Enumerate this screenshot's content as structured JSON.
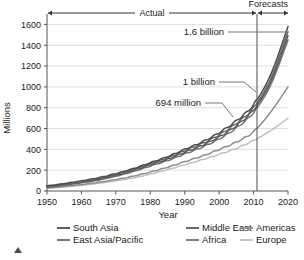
{
  "chart_data": {
    "type": "line",
    "title": "",
    "xlabel": "Year",
    "ylabel": "Millions",
    "xlim": [
      1950,
      2020
    ],
    "ylim": [
      0,
      1700
    ],
    "xticks": [
      "1950",
      "1960",
      "1970",
      "1980",
      "1990",
      "2000",
      "2010",
      "2020"
    ],
    "yticks": [
      "0",
      "200",
      "400",
      "600",
      "800",
      "1000",
      "1200",
      "1400",
      "1600"
    ],
    "grid": true,
    "legend_position": "bottom",
    "forecast_divider_year": 2011,
    "bands": [
      {
        "label": "Actual",
        "from": 1950,
        "to": 2011
      },
      {
        "label": "Forecasts",
        "from": 2011,
        "to": 2020
      }
    ],
    "annotations": [
      {
        "label": "1.6 billion",
        "value": 1600,
        "year": 2020
      },
      {
        "label": "1 billion",
        "value": 1000,
        "year": 2011
      },
      {
        "label": "694 million",
        "value": 694,
        "year": 2004
      }
    ],
    "x": [
      1950,
      1955,
      1960,
      1965,
      1970,
      1975,
      1980,
      1985,
      1990,
      1995,
      2000,
      2005,
      2010,
      2015,
      2020
    ],
    "series": [
      {
        "name": "South Asia",
        "color": "#4d4d4d",
        "values": [
          50,
          72,
          98,
          128,
          168,
          215,
          272,
          330,
          400,
          470,
          560,
          675,
          830,
          1120,
          1580
        ]
      },
      {
        "name": "East Asia/Pacific",
        "color": "#666666",
        "values": [
          44,
          64,
          88,
          118,
          158,
          205,
          262,
          318,
          388,
          455,
          540,
          650,
          800,
          1080,
          1530
        ]
      },
      {
        "name": "Middle East",
        "color": "#595959",
        "values": [
          40,
          60,
          84,
          112,
          150,
          196,
          252,
          306,
          372,
          438,
          520,
          628,
          780,
          1050,
          1490
        ]
      },
      {
        "name": "Africa",
        "color": "#737373",
        "values": [
          36,
          55,
          78,
          105,
          142,
          186,
          240,
          292,
          356,
          420,
          500,
          606,
          755,
          1020,
          1450
        ]
      },
      {
        "name": "Americas",
        "color": "#8c8c8c",
        "values": [
          30,
          44,
          62,
          84,
          110,
          142,
          182,
          228,
          282,
          335,
          398,
          470,
          570,
          760,
          1000
        ]
      },
      {
        "name": "Europe",
        "color": "#bfbfbf",
        "values": [
          26,
          38,
          54,
          74,
          98,
          126,
          162,
          205,
          252,
          300,
          352,
          410,
          485,
          580,
          700
        ]
      }
    ]
  },
  "footer": {
    "marker": "scroll-up-triangle"
  }
}
